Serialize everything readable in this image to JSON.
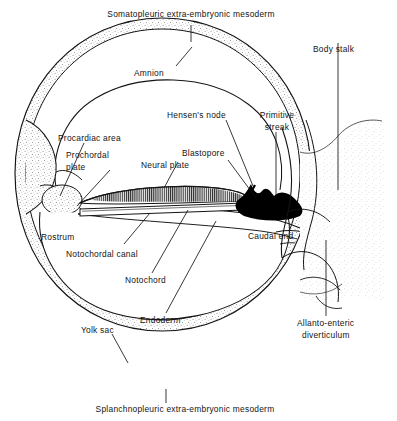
{
  "figure": {
    "title_top": "Somatopleuric extra-embryonic mesoderm",
    "title_bottom": "Splanchnopleuric extra-embryonic mesoderm",
    "type": "anatomical-diagram",
    "colors": {
      "ink": "#141414",
      "stipple": "#8d8d8d",
      "blastopore_fill": "#000000",
      "background": "#ffffff",
      "neural_plate_hatch": "#2b2b2b"
    }
  },
  "labels": {
    "somatopleuric": "Somatopleuric extra-embryonic mesoderm",
    "amnion": "Amnion",
    "body_stalk": "Body stalk",
    "hensens_node": "Hensen's node",
    "primitive_streak_l1": "Primitive",
    "primitive_streak_l2": "streak",
    "procardiac_area": "Procardiac area",
    "prochordal_plate_l1": "Prochordal",
    "prochordal_plate_l2": "plate",
    "blastopore": "Blastopore",
    "neural_plate": "Neural plate",
    "rostrum": "Rostrum",
    "notochordal_canal": "Notochordal canal",
    "notochord": "Notochord",
    "caudal_end": "Caudal end",
    "endoderm": "Endoderm",
    "yolk_sac": "Yolk sac",
    "allanto_enteric_l1": "Allanto-enteric",
    "allanto_enteric_l2": "diverticulum",
    "splanchnopleuric": "Splanchnopleuric extra-embryonic mesoderm"
  },
  "structures": [
    {
      "name": "chorionic-vesicle-wall",
      "description": "outer stippled double-walled circle"
    },
    {
      "name": "amniotic-cavity",
      "description": "upper chamber above embryonic disc"
    },
    {
      "name": "yolk-sac-cavity",
      "description": "lower chamber below embryonic disc"
    },
    {
      "name": "embryonic-disc",
      "description": "central lens-shaped bilaminar disc"
    },
    {
      "name": "neural-plate",
      "description": "hatched thickened ectoderm on dorsal disc"
    },
    {
      "name": "notochordal-canal",
      "description": "narrow tube beneath neural plate"
    },
    {
      "name": "primitive-streak-mass",
      "description": "solid black caudal mass"
    },
    {
      "name": "body-stalk",
      "description": "connecting stalk at right of vesicle"
    },
    {
      "name": "allanto-enteric-diverticulum",
      "description": "outpouching into body stalk"
    }
  ]
}
